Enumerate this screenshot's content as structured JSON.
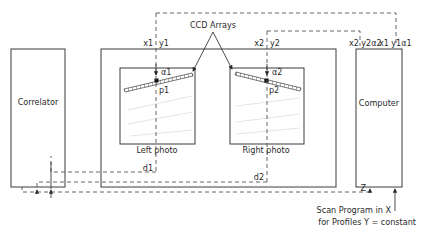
{
  "diagram": {
    "title_label": "CCD Arrays",
    "blocks": {
      "correlator": "Correlator",
      "computer": "Computer",
      "left_photo": "Left photo",
      "right_photo": "Right photo"
    },
    "left_photo_labels": {
      "x": "x1",
      "y": "y1",
      "alpha": "α1",
      "point": "p1",
      "d": "d1"
    },
    "right_photo_labels": {
      "x": "x2",
      "y": "y2",
      "alpha": "α2",
      "point": "p2",
      "d": "d2"
    },
    "computer_inputs": {
      "group2": "x2 y2α2",
      "group1": "x1 y1α1"
    },
    "z_label": "Z",
    "scan_note": {
      "line1": "Scan Program in X",
      "line2": "for Profiles Y = constant"
    },
    "colors": {
      "stroke": "#3a3a3a",
      "dash": "#555555",
      "background": "#ffffff"
    }
  }
}
